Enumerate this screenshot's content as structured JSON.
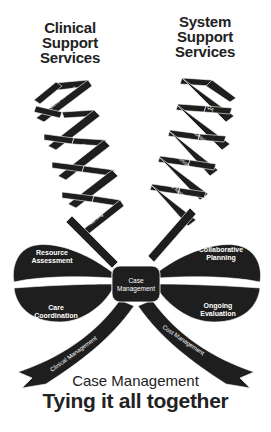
{
  "headings": {
    "left": [
      "Clinical",
      "Support",
      "Services"
    ],
    "right": [
      "System",
      "Support",
      "Services"
    ]
  },
  "left_helix": [
    "Social Services",
    "Therapies",
    "Diagnostics",
    "Physicians",
    "Nursing"
  ],
  "right_helix": [
    "UR / QA",
    "Data Processing",
    "Administration",
    "Medical Records",
    "Finance"
  ],
  "bow": {
    "center": [
      "Case",
      "Management"
    ],
    "top_left": [
      "Resource",
      "Assessment"
    ],
    "bottom_left": [
      "Care",
      "Coordination"
    ],
    "top_right": [
      "Collaborative",
      "Planning"
    ],
    "bottom_right": [
      "Ongoing",
      "Evaluation"
    ]
  },
  "tails": {
    "left": "Clinical Management",
    "right": "Cost Management"
  },
  "footer": {
    "subtitle": "Case Management",
    "title": "Tying it all together"
  },
  "colors": {
    "ribbon": "#1e1e1e",
    "text": "#222222",
    "background": "#ffffff"
  }
}
